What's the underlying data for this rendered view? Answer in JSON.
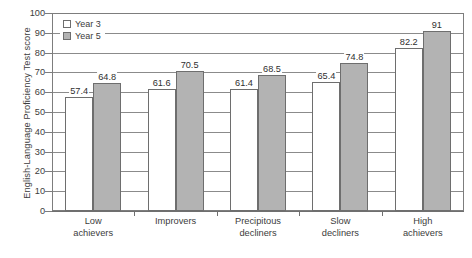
{
  "chart_data": {
    "type": "bar",
    "title": "",
    "xlabel": "",
    "ylabel": "English-Language Proficiency Test score",
    "ylim": [
      0,
      100
    ],
    "ytick_step": 10,
    "yticks": [
      0,
      10,
      20,
      30,
      40,
      50,
      60,
      70,
      80,
      90,
      100
    ],
    "grid": true,
    "grid_axis": "y",
    "legend_position": "top-left inside plot",
    "categories": [
      "Low\nachievers",
      "Improvers",
      "Precipitous\ndecliners",
      "Slow\ndecliners",
      "High\nachievers"
    ],
    "category_lines": [
      [
        "Low",
        "achievers"
      ],
      [
        "Improvers",
        ""
      ],
      [
        "Precipitous",
        "decliners"
      ],
      [
        "Slow",
        "decliners"
      ],
      [
        "High",
        "achievers"
      ]
    ],
    "series": [
      {
        "name": "Year 3",
        "color": "#ffffff",
        "values": [
          57.4,
          61.6,
          61.4,
          65.4,
          82.2
        ],
        "labels": [
          "57.4",
          "61.6",
          "61.4",
          "65.4",
          "82.2"
        ]
      },
      {
        "name": "Year 5",
        "color": "#b3b3b3",
        "values": [
          64.8,
          70.5,
          68.5,
          74.8,
          91
        ],
        "labels": [
          "64.8",
          "70.5",
          "68.5",
          "74.8",
          "91"
        ]
      }
    ]
  },
  "legend": {
    "items": [
      {
        "label": "Year 3",
        "swatch": "year-3-swatch"
      },
      {
        "label": "Year 5",
        "swatch": "year-5-swatch"
      }
    ]
  },
  "axes": {
    "y_title": "English-Language Proficiency Test score",
    "y_tick_labels": [
      "100",
      "90",
      "80",
      "70",
      "60",
      "50",
      "40",
      "30",
      "20",
      "10",
      "0"
    ]
  },
  "caption": {
    "text": ""
  },
  "colors": {
    "year3_fill": "#ffffff",
    "year5_fill": "#b3b3b3",
    "bar_stroke": "#6e6e6e",
    "axis": "#6f6f6f",
    "grid": "#8b8b8b",
    "text": "#3c3c3c"
  }
}
